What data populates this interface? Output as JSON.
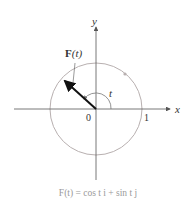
{
  "diagram": {
    "type": "unit-circle-vector-field",
    "axes": {
      "x_label": "x",
      "y_label": "y",
      "origin_label": "0",
      "unit_tick_label": "1"
    },
    "vector_label_bold": "F",
    "vector_label_arg": "(t)",
    "angle_label": "t",
    "caption": "F(t) = cos t i + sin t j",
    "colors": {
      "circle": "#b8b0b0",
      "axis": "#555555",
      "vector": "#111111",
      "caption": "#9a9a9a"
    },
    "angle_deg": 140
  }
}
